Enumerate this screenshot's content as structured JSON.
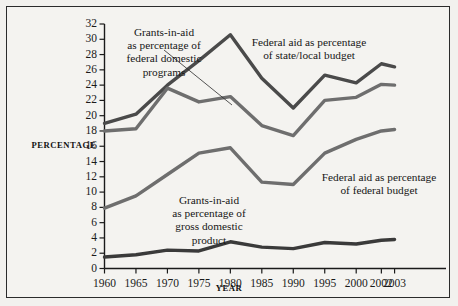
{
  "chart_data": {
    "type": "line",
    "title": "",
    "xlabel": "YEAR",
    "ylabel": "PERCENTAGE",
    "x": [
      1960,
      1965,
      1970,
      1975,
      1980,
      1985,
      1990,
      1995,
      2000,
      2002,
      2003
    ],
    "categories": [
      "1960",
      "1965",
      "1970",
      "1975",
      "1980",
      "1985",
      "1990",
      "1995",
      "2000",
      "2002",
      "2003"
    ],
    "xlim": [
      1960,
      2003
    ],
    "ylim": [
      0,
      32
    ],
    "ytick_step": 2,
    "yticks": [
      0,
      2,
      4,
      6,
      8,
      10,
      12,
      14,
      16,
      18,
      20,
      22,
      24,
      26,
      28,
      30,
      32
    ],
    "grid": false,
    "legend": "annotations-inline",
    "series": [
      {
        "name": "Federal aid as percentage of state/local budget",
        "color": "#4a4a4a",
        "values": [
          19.0,
          20.2,
          24.0,
          27.2,
          30.6,
          24.9,
          21.0,
          25.3,
          24.3,
          26.8,
          26.4
        ]
      },
      {
        "name": "Grants-in-aid as percentage of federal domestic programs",
        "color": "#6e6e6e",
        "values": [
          18.0,
          18.3,
          23.6,
          21.8,
          22.5,
          18.7,
          17.4,
          22.0,
          22.4,
          24.1,
          24.0
        ]
      },
      {
        "name": "Federal aid as percentage of federal budget",
        "color": "#6e6e6e",
        "values": [
          7.9,
          9.5,
          12.3,
          15.1,
          15.8,
          11.3,
          11.0,
          15.1,
          16.9,
          18.0,
          18.2
        ]
      },
      {
        "name": "Grants-in-aid as percentage of gross domestic product",
        "color": "#3a3a3a",
        "values": [
          1.5,
          1.8,
          2.4,
          2.3,
          3.5,
          2.8,
          2.6,
          3.4,
          3.2,
          3.7,
          3.8
        ]
      }
    ],
    "annotations": [
      {
        "id": "annot-federal-domestic-programs",
        "text": "Grants-in-aid\nas percentage of\nfederal domestic\nprograms",
        "line1": "Grants-in-aid",
        "line2": "as percentage of",
        "line3": "federal domestic",
        "line4": "programs",
        "leader_line": true
      },
      {
        "id": "annot-state-local-budget",
        "text": "Federal aid as percentage\nof state/local budget",
        "line1": "Federal aid as percentage",
        "line2": "of state/local budget",
        "leader_line": false
      },
      {
        "id": "annot-federal-budget",
        "text": "Federal aid as percentage\nof federal budget",
        "line1": "Federal aid as percentage",
        "line2": "of federal budget",
        "leader_line": false
      },
      {
        "id": "annot-gdp",
        "text": "Grants-in-aid\nas percentage of\ngross domestic\nproduct",
        "line1": "Grants-in-aid",
        "line2": "as percentage of",
        "line3": "gross domestic",
        "line4": "product",
        "leader_line": false
      }
    ]
  },
  "colors": {
    "background": "#f2f1ee",
    "panel": "#f4f3f0",
    "border": "#2b2b2b",
    "axis": "#1a1a1a",
    "text": "#171717"
  }
}
